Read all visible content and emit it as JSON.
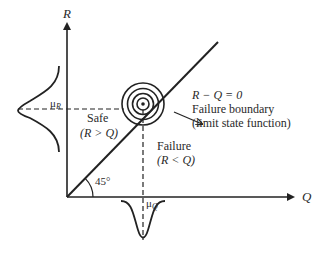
{
  "diagram": {
    "axes": {
      "y_label": "R",
      "x_label": "Q"
    },
    "means": {
      "mu_r": "μ",
      "mu_r_sub": "R",
      "mu_q": "μ",
      "mu_q_sub": "Q"
    },
    "regions": {
      "safe_title": "Safe",
      "safe_condition": "(R > Q)",
      "failure_title": "Failure",
      "failure_condition": "(R < Q)"
    },
    "boundary": {
      "equation": "R − Q = 0",
      "line1": "Failure boundary",
      "line2": "(limit state function)"
    },
    "angle": "45°",
    "contour_rings": 4
  }
}
